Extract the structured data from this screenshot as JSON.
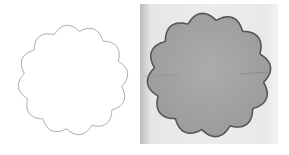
{
  "figure": {
    "panels": [
      {
        "name": "outline-scalloped-circle",
        "lobes": 12,
        "stroke": "#9a9a9a",
        "fill": "#ffffff"
      },
      {
        "name": "photo-scalloped-disc",
        "lobes": 12,
        "fill": "#a3a3a3",
        "edge": "#5a5a5a",
        "background": "#e8e8e8"
      }
    ]
  }
}
